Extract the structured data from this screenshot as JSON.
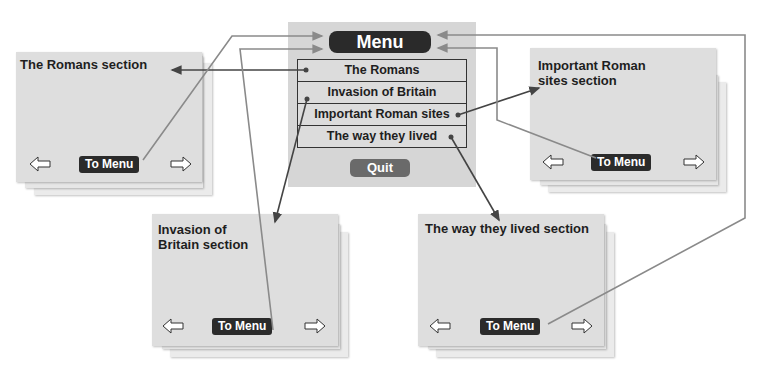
{
  "menu": {
    "title": "Menu",
    "items": [
      {
        "label": "The Romans"
      },
      {
        "label": "Invasion of Britain"
      },
      {
        "label": "Important Roman sites"
      },
      {
        "label": "The way they lived"
      }
    ],
    "quit_label": "Quit"
  },
  "sections": {
    "romans": {
      "title": "The Romans section",
      "to_menu": "To Menu",
      "prev_icon": "left-arrow-icon",
      "next_icon": "right-arrow-icon"
    },
    "invasion": {
      "title_line1": "Invasion of",
      "title_line2": "Britain section",
      "to_menu": "To Menu",
      "prev_icon": "left-arrow-icon",
      "next_icon": "right-arrow-icon"
    },
    "sites": {
      "title_line1": "Important Roman",
      "title_line2": "sites section",
      "to_menu": "To Menu",
      "prev_icon": "left-arrow-icon",
      "next_icon": "right-arrow-icon"
    },
    "lived": {
      "title": "The way they lived section",
      "to_menu": "To Menu",
      "prev_icon": "left-arrow-icon",
      "next_icon": "right-arrow-icon"
    }
  },
  "colors": {
    "dark_button": "#2b2b2b",
    "quit_button": "#6a6a6a",
    "card": "#e0e0e0",
    "menu_panel": "#d6d6d6",
    "link_dark": "#444444",
    "link_grey": "#8a8a8a"
  }
}
